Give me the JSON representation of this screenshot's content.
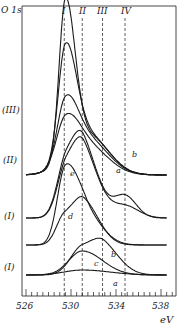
{
  "chart_data": {
    "type": "line",
    "title": "",
    "ylabel": "O 1s",
    "xlabel": "eV",
    "xlim": [
      526,
      539
    ],
    "x_ticks": [
      526,
      530,
      534,
      538
    ],
    "x_minor_step": 0.5,
    "reference_lines": [
      {
        "label": "I",
        "x": 529.4
      },
      {
        "label": "II",
        "x": 531.0
      },
      {
        "label": "III",
        "x": 532.8
      },
      {
        "label": "IV",
        "x": 534.8
      }
    ],
    "groups": [
      {
        "label": "(III)",
        "baseline_y": 175,
        "curves": [
          {
            "name": "III-1",
            "peaks": [
              {
                "x": 529.5,
                "h": 155,
                "w": 0.7
              }
            ],
            "tail": {
              "x": 531.5,
              "h": 40,
              "w": 1.8
            }
          },
          {
            "name": "III-2",
            "peaks": [
              {
                "x": 529.5,
                "h": 110,
                "w": 0.8
              }
            ],
            "tail": {
              "x": 531.5,
              "h": 40,
              "w": 1.8
            }
          },
          {
            "name": "III-3",
            "peaks": [
              {
                "x": 529.5,
                "h": 60,
                "w": 0.9
              }
            ],
            "tail": {
              "x": 531.5,
              "h": 35,
              "w": 1.8
            }
          },
          {
            "name": "III-4",
            "peaks": [
              {
                "x": 529.5,
                "h": 45,
                "w": 1.0
              }
            ],
            "tail": {
              "x": 531.5,
              "h": 28,
              "w": 1.8
            }
          }
        ]
      },
      {
        "label": "(II)",
        "baseline_y": 218,
        "curves": [
          {
            "name": "a",
            "peaks": [
              {
                "x": 529.6,
                "h": 52,
                "w": 1.0
              },
              {
                "x": 531.2,
                "h": 55,
                "w": 1.1
              }
            ],
            "tail": {
              "x": 534.8,
              "h": 12,
              "w": 1.2
            }
          },
          {
            "name": "b",
            "peaks": [
              {
                "x": 529.6,
                "h": 58,
                "w": 1.0
              },
              {
                "x": 531.2,
                "h": 58,
                "w": 1.1
              }
            ],
            "tail": {
              "x": 534.8,
              "h": 22,
              "w": 1.0
            }
          }
        ],
        "annotations": [
          {
            "text": "a",
            "x": 534.3,
            "y_offset": -10
          },
          {
            "text": "b",
            "x": 535.3,
            "y_offset": -28
          }
        ]
      },
      {
        "label": "(I)",
        "baseline_y": 245,
        "curves": [
          {
            "name": "e",
            "peaks": [
              {
                "x": 529.5,
                "h": 75,
                "w": 0.9
              },
              {
                "x": 531.3,
                "h": 30,
                "w": 1.2
              }
            ]
          },
          {
            "name": "d",
            "peaks": [
              {
                "x": 529.4,
                "h": 28,
                "w": 0.9
              },
              {
                "x": 531.2,
                "h": 40,
                "w": 1.1
              }
            ]
          }
        ],
        "annotations": [
          {
            "text": "e",
            "x": 530.2,
            "y_offset": -78
          },
          {
            "text": "d",
            "x": 530.0,
            "y_offset": -18
          }
        ]
      },
      {
        "label": "(I)",
        "baseline_y": 275,
        "curves": [
          {
            "name": "b",
            "peaks": [
              {
                "x": 531.0,
                "h": 28,
                "w": 1.3
              },
              {
                "x": 533.0,
                "h": 22,
                "w": 1.2
              }
            ]
          },
          {
            "name": "c",
            "peaks": [
              {
                "x": 531.0,
                "h": 24,
                "w": 1.5
              }
            ]
          },
          {
            "name": "a",
            "peaks": [
              {
                "x": 531.0,
                "h": 5,
                "w": 2.0
              }
            ]
          }
        ],
        "annotations": [
          {
            "text": "b",
            "x": 533.6,
            "y_offset": -32
          },
          {
            "text": "c",
            "x": 532.0,
            "y_offset": -12
          },
          {
            "text": "a",
            "x": 533.8,
            "y_offset": 8
          }
        ]
      }
    ],
    "grid": false,
    "legend": "none"
  },
  "labels": {
    "y_axis": "O 1s",
    "x_unit": "eV",
    "tick_526": "526",
    "tick_530": "530",
    "tick_534": "534",
    "tick_538": "538",
    "line_I": "I",
    "line_II": "II",
    "line_III": "III",
    "line_IV": "IV",
    "group_III": "(III)",
    "group_II": "(II)",
    "group_I_upper": "(I)",
    "group_I_lower": "(I)",
    "ann_II_a": "a",
    "ann_II_b": "b",
    "ann_Iu_e": "e",
    "ann_Iu_d": "d",
    "ann_Il_b": "b",
    "ann_Il_c": "c",
    "ann_Il_a": "a"
  }
}
